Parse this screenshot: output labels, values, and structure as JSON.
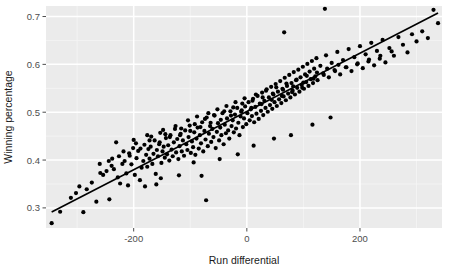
{
  "chart_data": {
    "type": "scatter",
    "title": "",
    "xlabel": "Run differential",
    "ylabel": "Winning percentage",
    "xlim": [
      -355,
      345
    ],
    "ylim": [
      0.258,
      0.722
    ],
    "xticks": [
      -200,
      0,
      200
    ],
    "xtick_labels": [
      "-200",
      "0",
      "200"
    ],
    "yticks": [
      0.3,
      0.4,
      0.5,
      0.6,
      0.7
    ],
    "ytick_labels": [
      "0.3",
      "0.4",
      "0.5",
      "0.6",
      "0.7"
    ],
    "x_minor_ticks": [
      -300,
      -100,
      100,
      300
    ],
    "y_minor_ticks": [
      0.35,
      0.45,
      0.55,
      0.65
    ],
    "grid": true,
    "legend": "none",
    "panel_background": "#ebebeb",
    "major_grid_color": "#ffffff",
    "minor_grid_color": "#f5f5f5",
    "point_color": "#000000",
    "point_size": 4.2,
    "line_color": "#000000",
    "line_width": 1.6,
    "trend_line": {
      "x_start": -345,
      "y_start": 0.2915,
      "x_end": 338,
      "y_end": 0.7075,
      "description": "linear best fit"
    },
    "points": [
      [
        -345,
        0.268
      ],
      [
        -330,
        0.292
      ],
      [
        -311,
        0.321
      ],
      [
        -302,
        0.331
      ],
      [
        -296,
        0.345
      ],
      [
        -289,
        0.291
      ],
      [
        -283,
        0.339
      ],
      [
        -274,
        0.353
      ],
      [
        -266,
        0.313
      ],
      [
        -259,
        0.373
      ],
      [
        -254,
        0.369
      ],
      [
        -248,
        0.377
      ],
      [
        -243,
        0.318
      ],
      [
        -239,
        0.388
      ],
      [
        -235,
        0.381
      ],
      [
        -231,
        0.437
      ],
      [
        -228,
        0.364
      ],
      [
        -224,
        0.351
      ],
      [
        -220,
        0.392
      ],
      [
        -216,
        0.398
      ],
      [
        -213,
        0.372
      ],
      [
        -210,
        0.347
      ],
      [
        -207,
        0.409
      ],
      [
        -204,
        0.391
      ],
      [
        -201,
        0.425
      ],
      [
        -198,
        0.369
      ],
      [
        -195,
        0.404
      ],
      [
        -192,
        0.419
      ],
      [
        -189,
        0.358
      ],
      [
        -186,
        0.384
      ],
      [
        -183,
        0.398
      ],
      [
        -181,
        0.432
      ],
      [
        -178,
        0.411
      ],
      [
        -176,
        0.386
      ],
      [
        -174,
        0.423
      ],
      [
        -172,
        0.403
      ],
      [
        -169,
        0.449
      ],
      [
        -167,
        0.392
      ],
      [
        -165,
        0.413
      ],
      [
        -163,
        0.441
      ],
      [
        -161,
        0.371
      ],
      [
        -159,
        0.421
      ],
      [
        -157,
        0.408
      ],
      [
        -155,
        0.433
      ],
      [
        -153,
        0.457
      ],
      [
        -151,
        0.394
      ],
      [
        -149,
        0.418
      ],
      [
        -147,
        0.428
      ],
      [
        -145,
        0.405
      ],
      [
        -143,
        0.446
      ],
      [
        -141,
        0.412
      ],
      [
        -139,
        0.431
      ],
      [
        -137,
        0.399
      ],
      [
        -135,
        0.452
      ],
      [
        -133,
        0.422
      ],
      [
        -131,
        0.408
      ],
      [
        -129,
        0.437
      ],
      [
        -127,
        0.465
      ],
      [
        -125,
        0.416
      ],
      [
        -123,
        0.444
      ],
      [
        -121,
        0.402
      ],
      [
        -119,
        0.429
      ],
      [
        -117,
        0.455
      ],
      [
        -115,
        0.418
      ],
      [
        -113,
        0.441
      ],
      [
        -111,
        0.409
      ],
      [
        -109,
        0.462
      ],
      [
        -107,
        0.433
      ],
      [
        -105,
        0.421
      ],
      [
        -103,
        0.448
      ],
      [
        -101,
        0.472
      ],
      [
        -99,
        0.415
      ],
      [
        -97,
        0.439
      ],
      [
        -95,
        0.427
      ],
      [
        -93,
        0.458
      ],
      [
        -91,
        0.411
      ],
      [
        -89,
        0.445
      ],
      [
        -87,
        0.468
      ],
      [
        -85,
        0.424
      ],
      [
        -83,
        0.452
      ],
      [
        -81,
        0.435
      ],
      [
        -79,
        0.479
      ],
      [
        -77,
        0.418
      ],
      [
        -75,
        0.461
      ],
      [
        -73,
        0.443
      ],
      [
        -71,
        0.489
      ],
      [
        -69,
        0.429
      ],
      [
        -67,
        0.455
      ],
      [
        -65,
        0.471
      ],
      [
        -63,
        0.438
      ],
      [
        -61,
        0.465
      ],
      [
        -59,
        0.448
      ],
      [
        -57,
        0.493
      ],
      [
        -55,
        0.425
      ],
      [
        -53,
        0.459
      ],
      [
        -51,
        0.477
      ],
      [
        -49,
        0.441
      ],
      [
        -47,
        0.468
      ],
      [
        -45,
        0.452
      ],
      [
        -43,
        0.498
      ],
      [
        -41,
        0.433
      ],
      [
        -39,
        0.474
      ],
      [
        -37,
        0.456
      ],
      [
        -35,
        0.487
      ],
      [
        -33,
        0.462
      ],
      [
        -31,
        0.445
      ],
      [
        -29,
        0.502
      ],
      [
        -27,
        0.471
      ],
      [
        -25,
        0.483
      ],
      [
        -23,
        0.458
      ],
      [
        -21,
        0.495
      ],
      [
        -19,
        0.466
      ],
      [
        -17,
        0.509
      ],
      [
        -15,
        0.478
      ],
      [
        -13,
        0.452
      ],
      [
        -11,
        0.491
      ],
      [
        -9,
        0.504
      ],
      [
        -7,
        0.469
      ],
      [
        -5,
        0.487
      ],
      [
        -3,
        0.512
      ],
      [
        -1,
        0.475
      ],
      [
        1,
        0.498
      ],
      [
        3,
        0.521
      ],
      [
        5,
        0.483
      ],
      [
        7,
        0.506
      ],
      [
        9,
        0.492
      ],
      [
        11,
        0.528
      ],
      [
        13,
        0.479
      ],
      [
        15,
        0.511
      ],
      [
        17,
        0.497
      ],
      [
        19,
        0.534
      ],
      [
        21,
        0.486
      ],
      [
        23,
        0.518
      ],
      [
        25,
        0.503
      ],
      [
        27,
        0.541
      ],
      [
        29,
        0.494
      ],
      [
        31,
        0.524
      ],
      [
        33,
        0.509
      ],
      [
        35,
        0.548
      ],
      [
        37,
        0.501
      ],
      [
        39,
        0.531
      ],
      [
        41,
        0.515
      ],
      [
        43,
        0.553
      ],
      [
        45,
        0.507
      ],
      [
        47,
        0.537
      ],
      [
        49,
        0.521
      ],
      [
        51,
        0.559
      ],
      [
        53,
        0.513
      ],
      [
        55,
        0.543
      ],
      [
        57,
        0.527
      ],
      [
        59,
        0.565
      ],
      [
        61,
        0.519
      ],
      [
        63,
        0.549
      ],
      [
        65,
        0.533
      ],
      [
        67,
        0.572
      ],
      [
        69,
        0.525
      ],
      [
        71,
        0.555
      ],
      [
        73,
        0.539
      ],
      [
        75,
        0.578
      ],
      [
        77,
        0.531
      ],
      [
        79,
        0.561
      ],
      [
        81,
        0.545
      ],
      [
        83,
        0.584
      ],
      [
        85,
        0.537
      ],
      [
        87,
        0.567
      ],
      [
        89,
        0.551
      ],
      [
        91,
        0.589
      ],
      [
        93,
        0.543
      ],
      [
        95,
        0.573
      ],
      [
        97,
        0.557
      ],
      [
        99,
        0.595
      ],
      [
        101,
        0.549
      ],
      [
        103,
        0.579
      ],
      [
        105,
        0.563
      ],
      [
        107,
        0.601
      ],
      [
        109,
        0.555
      ],
      [
        111,
        0.585
      ],
      [
        113,
        0.569
      ],
      [
        115,
        0.607
      ],
      [
        117,
        0.561
      ],
      [
        119,
        0.591
      ],
      [
        121,
        0.575
      ],
      [
        123,
        0.613
      ],
      [
        125,
        0.567
      ],
      [
        130,
        0.597
      ],
      [
        135,
        0.581
      ],
      [
        140,
        0.619
      ],
      [
        145,
        0.573
      ],
      [
        150,
        0.603
      ],
      [
        155,
        0.588
      ],
      [
        160,
        0.626
      ],
      [
        165,
        0.579
      ],
      [
        170,
        0.609
      ],
      [
        175,
        0.594
      ],
      [
        180,
        0.632
      ],
      [
        185,
        0.586
      ],
      [
        190,
        0.615
      ],
      [
        195,
        0.6
      ],
      [
        200,
        0.638
      ],
      [
        205,
        0.592
      ],
      [
        210,
        0.621
      ],
      [
        215,
        0.606
      ],
      [
        220,
        0.645
      ],
      [
        225,
        0.598
      ],
      [
        230,
        0.628
      ],
      [
        235,
        0.612
      ],
      [
        240,
        0.651
      ],
      [
        245,
        0.604
      ],
      [
        252,
        0.634
      ],
      [
        260,
        0.618
      ],
      [
        268,
        0.657
      ],
      [
        276,
        0.641
      ],
      [
        284,
        0.625
      ],
      [
        292,
        0.663
      ],
      [
        300,
        0.648
      ],
      [
        310,
        0.669
      ],
      [
        320,
        0.655
      ],
      [
        330,
        0.714
      ],
      [
        338,
        0.686
      ],
      [
        -80,
        0.367
      ],
      [
        -72,
        0.316
      ],
      [
        66,
        0.667
      ],
      [
        138,
        0.716
      ],
      [
        -180,
        0.345
      ],
      [
        -160,
        0.349
      ],
      [
        -152,
        0.362
      ],
      [
        -120,
        0.368
      ],
      [
        -94,
        0.395
      ],
      [
        -48,
        0.402
      ],
      [
        -16,
        0.412
      ],
      [
        12,
        0.43
      ],
      [
        48,
        0.445
      ],
      [
        78,
        0.452
      ],
      [
        116,
        0.474
      ],
      [
        148,
        0.489
      ],
      [
        -238,
        0.403
      ],
      [
        -226,
        0.408
      ],
      [
        -208,
        0.414
      ],
      [
        -188,
        0.424
      ],
      [
        -170,
        0.428
      ],
      [
        -154,
        0.437
      ],
      [
        -136,
        0.448
      ],
      [
        -118,
        0.452
      ],
      [
        -100,
        0.461
      ],
      [
        -82,
        0.469
      ],
      [
        -64,
        0.478
      ],
      [
        -46,
        0.484
      ],
      [
        -28,
        0.493
      ],
      [
        -10,
        0.501
      ],
      [
        8,
        0.509
      ],
      [
        26,
        0.517
      ],
      [
        44,
        0.526
      ],
      [
        62,
        0.534
      ],
      [
        80,
        0.542
      ],
      [
        98,
        0.551
      ],
      [
        -200,
        0.442
      ],
      [
        -176,
        0.452
      ],
      [
        -148,
        0.463
      ],
      [
        -126,
        0.471
      ],
      [
        -104,
        0.483
      ],
      [
        -88,
        0.491
      ],
      [
        -68,
        0.498
      ],
      [
        -52,
        0.506
      ],
      [
        -36,
        0.513
      ],
      [
        -20,
        0.521
      ],
      [
        -4,
        0.529
      ],
      [
        16,
        0.537
      ],
      [
        34,
        0.545
      ],
      [
        52,
        0.552
      ],
      [
        70,
        0.56
      ],
      [
        88,
        0.568
      ],
      [
        106,
        0.576
      ],
      [
        124,
        0.583
      ],
      [
        142,
        0.591
      ],
      [
        162,
        0.599
      ],
      [
        -260,
        0.392
      ],
      [
        -244,
        0.398
      ],
      [
        -218,
        0.418
      ],
      [
        -196,
        0.435
      ],
      [
        -172,
        0.441
      ],
      [
        -144,
        0.454
      ],
      [
        -116,
        0.466
      ],
      [
        -92,
        0.475
      ],
      [
        -74,
        0.486
      ],
      [
        -58,
        0.494
      ],
      [
        -40,
        0.502
      ],
      [
        -24,
        0.51
      ],
      [
        -8,
        0.518
      ],
      [
        10,
        0.524
      ],
      [
        28,
        0.531
      ],
      [
        46,
        0.539
      ],
      [
        64,
        0.547
      ],
      [
        82,
        0.554
      ],
      [
        100,
        0.562
      ],
      [
        118,
        0.57
      ],
      [
        136,
        0.578
      ],
      [
        156,
        0.586
      ],
      [
        176,
        0.594
      ],
      [
        196,
        0.602
      ],
      [
        216,
        0.61
      ],
      [
        236,
        0.618
      ],
      [
        256,
        0.627
      ]
    ]
  }
}
